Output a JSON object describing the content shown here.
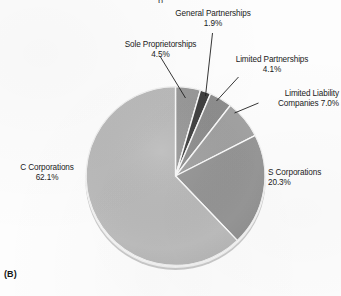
{
  "figure": {
    "panel_label": "(B)",
    "title_fragment": "p",
    "background_color": "#fdfdfd"
  },
  "chart_data": {
    "type": "pie",
    "title": "",
    "xlabel": "",
    "ylabel": "",
    "legend_position": "none",
    "grid": false,
    "labels_outside": true,
    "start_angle_deg": 0,
    "direction": "clockwise",
    "categories": [
      "Sole Proprietorships",
      "General Partnerships",
      "Limited Partnerships",
      "Limited Liability Companies",
      "S Corporations",
      "C Corporations"
    ],
    "values": [
      4.5,
      1.9,
      4.1,
      7.0,
      20.3,
      62.1
    ],
    "value_suffix": "%",
    "slice_colors": [
      "#9a9a9a",
      "#3f3f3f",
      "#8f8f8f",
      "#a3a3a3",
      "#979797",
      "#bdbdbd"
    ],
    "separator_color": "#ffffff"
  },
  "slices": [
    {
      "name": "sole-proprietorships",
      "label_line1": "Sole Proprietorships",
      "label_line2": "4.5%",
      "value": 4.5,
      "color": "#9a9a9a"
    },
    {
      "name": "general-partnerships",
      "label_line1": "General Partnerships",
      "label_line2": "1.9%",
      "value": 1.9,
      "color": "#3f3f3f"
    },
    {
      "name": "limited-partnerships",
      "label_line1": "Limited Partnerships",
      "label_line2": "4.1%",
      "value": 4.1,
      "color": "#8f8f8f"
    },
    {
      "name": "limited-liability-companies",
      "label_line1": "Limited Liability",
      "label_line2": "Companies 7.0%",
      "value": 7.0,
      "color": "#a3a3a3"
    },
    {
      "name": "s-corporations",
      "label_line1": "S Corporations",
      "label_line2": "20.3%",
      "value": 20.3,
      "color": "#979797"
    },
    {
      "name": "c-corporations",
      "label_line1": "C Corporations",
      "label_line2": "62.1%",
      "value": 62.1,
      "color": "#bdbdbd"
    }
  ]
}
